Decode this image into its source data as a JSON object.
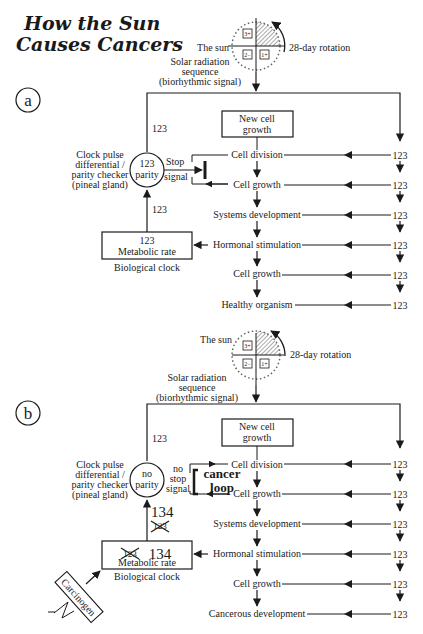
{
  "title": {
    "line1": "How the Sun",
    "line2": "Causes Cancers"
  },
  "panel_a": {
    "label": "a",
    "sun": {
      "label": "The sun",
      "rotation": "28-day rotation",
      "quadrants": [
        "1+",
        "2−",
        "3+"
      ],
      "signal": [
        "Solar radiation",
        "sequence",
        "(biorhythmic signal)"
      ]
    },
    "input_to_checker": "123",
    "checker": {
      "value": "123",
      "state": "parity",
      "caption": [
        "Clock pulse",
        "differential /",
        "parity checker",
        "(pineal gland)"
      ]
    },
    "signal_label": [
      "Stop",
      "signal"
    ],
    "metabolic_to_checker": "123",
    "metabolic": {
      "value": "123",
      "label": "Metabolic rate",
      "caption": "Biological clock"
    },
    "new_cell": [
      "New cell",
      "growth"
    ],
    "stages": [
      "Cell division",
      "Cell growth",
      "Systems development",
      "Hormonal stimulation",
      "Cell growth",
      "Healthy organism"
    ],
    "stage_inputs": [
      "123",
      "123",
      "123",
      "123",
      "123",
      "123"
    ]
  },
  "panel_b": {
    "label": "b",
    "sun": {
      "label": "The sun",
      "rotation": "28-day rotation",
      "quadrants": [
        "1+",
        "2−",
        "3+"
      ],
      "signal": [
        "Solar radiation",
        "sequence",
        "(biorhythmic signal)"
      ]
    },
    "input_to_checker": "123",
    "checker": {
      "value": "no",
      "state": "parity",
      "caption": [
        "Clock pulse",
        "differential /",
        "parity checker",
        "(pineal gland)"
      ]
    },
    "signal_label": [
      "no",
      "stop",
      "signal"
    ],
    "loop_label": [
      "cancer",
      "loop"
    ],
    "metabolic_to_checker": "134",
    "metabolic_to_checker_crossed": "123",
    "metabolic": {
      "value": "134",
      "crossed_value": "123",
      "label": "Metabolic rate",
      "caption": "Biological clock"
    },
    "carcinogen": "Carcinogen",
    "new_cell": [
      "New cell",
      "growth"
    ],
    "stages": [
      "Cell division",
      "Cell growth",
      "Systems development",
      "Hormonal stimulation",
      "Cell growth",
      "Cancerous development"
    ],
    "stage_inputs": [
      "123",
      "123",
      "123",
      "123",
      "123",
      "123"
    ]
  }
}
